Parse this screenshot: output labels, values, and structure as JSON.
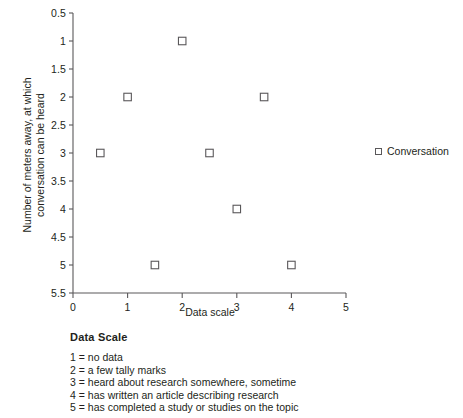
{
  "chart_data": {
    "type": "scatter",
    "title": "",
    "xlabel": "Data scale",
    "ylabel": "Number of meters away, at which\nconversation can be heard",
    "xlim": [
      0,
      5
    ],
    "ylim": [
      0.5,
      5.5
    ],
    "y_axis_inverted": true,
    "grid": false,
    "legend_position": "right",
    "xticks": [
      "0",
      "1",
      "2",
      "3",
      "4",
      "5"
    ],
    "xtick_values": [
      0,
      1,
      2,
      3,
      4,
      5
    ],
    "yticks": [
      "0.5",
      "1",
      "1.5",
      "2",
      "2.5",
      "3",
      "3.5",
      "4",
      "4.5",
      "5",
      "5.5"
    ],
    "ytick_values": [
      0.5,
      1,
      1.5,
      2,
      2.5,
      3,
      3.5,
      4,
      4.5,
      5,
      5.5
    ],
    "series": [
      {
        "name": "Conversation",
        "marker": "open-square",
        "marker_color": "#5a585a",
        "points": [
          {
            "x": 0.5,
            "y": 3
          },
          {
            "x": 1.0,
            "y": 2
          },
          {
            "x": 1.5,
            "y": 5
          },
          {
            "x": 2.0,
            "y": 1
          },
          {
            "x": 2.5,
            "y": 3
          },
          {
            "x": 3.0,
            "y": 4
          },
          {
            "x": 3.5,
            "y": 2
          },
          {
            "x": 4.0,
            "y": 5
          }
        ]
      }
    ]
  },
  "legend": {
    "series_label": "Conversation"
  },
  "scale_key": {
    "title": "Data Scale",
    "items": [
      "1 = no data",
      "2 = a few tally marks",
      "3 = heard about research somewhere, sometime",
      "4 = has written an article describing research",
      "5 = has completed a study or studies on the topic"
    ]
  },
  "colors": {
    "axis": "#5a585a",
    "text": "#231f20",
    "marker_stroke": "#5a585a",
    "background": "#ffffff"
  }
}
